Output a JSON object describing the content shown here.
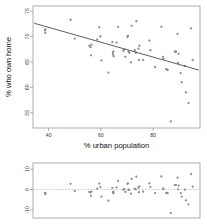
{
  "figure": {
    "background": "#ffffff",
    "point_color": "#8c8c8c",
    "line_color": "#4d4d4d",
    "axis_color": "#9a9a9a"
  },
  "chart_data": [
    {
      "type": "scatter",
      "panel": "main",
      "title": "",
      "xlabel": "% urban population",
      "ylabel": "% who own home",
      "xlim": [
        34,
        98
      ],
      "ylim": [
        52,
        76
      ],
      "xticks": [
        40,
        60,
        80
      ],
      "xticklabels": [
        "40",
        "60",
        "80"
      ],
      "yticks": [
        55,
        60,
        65,
        70,
        75
      ],
      "yticklabels": [
        "55",
        "60",
        "65",
        "70",
        "75"
      ],
      "grid": false,
      "legend": null,
      "regression_line": {
        "x": [
          34.5,
          97.5
        ],
        "y": [
          72.6,
          63.4
        ],
        "slope": -0.146,
        "intercept": 77.63
      },
      "points": [
        [
          38.6,
          71.2
        ],
        [
          38.7,
          70.7
        ],
        [
          38.8,
          71.4
        ],
        [
          48.4,
          73.3
        ],
        [
          50.0,
          69.6
        ],
        [
          55.6,
          68.2
        ],
        [
          56.0,
          67.9
        ],
        [
          56.2,
          66.3
        ],
        [
          56.4,
          68.4
        ],
        [
          58.6,
          69.4
        ],
        [
          59.4,
          71.8
        ],
        [
          59.8,
          70.0
        ],
        [
          60.2,
          65.3
        ],
        [
          62.9,
          62.9
        ],
        [
          64.4,
          68.9
        ],
        [
          64.6,
          66.8
        ],
        [
          64.7,
          66.4
        ],
        [
          64.8,
          67.0
        ],
        [
          64.9,
          66.1
        ],
        [
          66.0,
          68.8
        ],
        [
          66.6,
          71.9
        ],
        [
          68.6,
          67.2
        ],
        [
          69.0,
          67.4
        ],
        [
          69.4,
          66.0
        ],
        [
          70.2,
          69.9
        ],
        [
          70.4,
          70.1
        ],
        [
          70.6,
          67.0
        ],
        [
          70.9,
          66.8
        ],
        [
          71.5,
          64.9
        ],
        [
          71.8,
          72.1
        ],
        [
          73.0,
          67.3
        ],
        [
          73.4,
          66.8
        ],
        [
          73.6,
          73.0
        ],
        [
          74.4,
          67.6
        ],
        [
          74.6,
          65.4
        ],
        [
          74.8,
          68.2
        ],
        [
          76.2,
          65.4
        ],
        [
          78.6,
          69.2
        ],
        [
          79.0,
          67.3
        ],
        [
          80.8,
          64.0
        ],
        [
          83.2,
          71.9
        ],
        [
          83.8,
          66.0
        ],
        [
          84.0,
          65.6
        ],
        [
          85.0,
          63.6
        ],
        [
          85.4,
          63.5
        ],
        [
          85.6,
          63.4
        ],
        [
          86.8,
          53.3
        ],
        [
          88.4,
          67.0
        ],
        [
          88.6,
          67.0
        ],
        [
          88.8,
          67.0
        ],
        [
          89.4,
          70.5
        ],
        [
          89.6,
          64.8
        ],
        [
          89.8,
          66.6
        ],
        [
          90.6,
          62.8
        ],
        [
          91.0,
          61.0
        ],
        [
          92.2,
          64.2
        ],
        [
          92.6,
          59.0
        ],
        [
          93.6,
          56.9
        ],
        [
          94.6,
          71.6
        ],
        [
          95.2,
          65.4
        ]
      ]
    },
    {
      "type": "scatter",
      "panel": "residuals",
      "title": "",
      "xlabel": "",
      "ylabel": "",
      "xlim": [
        34,
        98
      ],
      "ylim": [
        -14,
        13
      ],
      "xticks": [],
      "xticklabels": [],
      "yticks": [
        -10,
        0,
        10
      ],
      "yticklabels": [
        "-10",
        "0",
        "10"
      ],
      "grid": false,
      "legend": null,
      "zero_line": 0,
      "points": [
        [
          38.6,
          -1.8
        ],
        [
          38.7,
          -2.3
        ],
        [
          38.8,
          -1.6
        ],
        [
          48.4,
          2.8
        ],
        [
          50.0,
          -0.7
        ],
        [
          55.6,
          -1.2
        ],
        [
          56.0,
          -1.5
        ],
        [
          56.2,
          -3.1
        ],
        [
          56.4,
          -1.0
        ],
        [
          58.6,
          0.4
        ],
        [
          59.4,
          2.9
        ],
        [
          59.8,
          1.2
        ],
        [
          60.2,
          -3.5
        ],
        [
          62.9,
          -5.5
        ],
        [
          64.4,
          0.8
        ],
        [
          64.6,
          -1.3
        ],
        [
          64.7,
          -1.6
        ],
        [
          64.8,
          -1.0
        ],
        [
          64.9,
          -1.9
        ],
        [
          66.0,
          1.0
        ],
        [
          66.6,
          4.2
        ],
        [
          68.6,
          -0.1
        ],
        [
          69.0,
          0.2
        ],
        [
          69.4,
          -1.2
        ],
        [
          70.2,
          2.8
        ],
        [
          70.4,
          3.0
        ],
        [
          70.6,
          -0.1
        ],
        [
          70.9,
          -0.2
        ],
        [
          71.5,
          -2.0
        ],
        [
          71.8,
          5.2
        ],
        [
          73.0,
          0.4
        ],
        [
          73.4,
          0.0
        ],
        [
          73.6,
          6.3
        ],
        [
          74.4,
          0.9
        ],
        [
          74.6,
          -1.3
        ],
        [
          74.8,
          1.5
        ],
        [
          76.2,
          -1.1
        ],
        [
          78.6,
          3.0
        ],
        [
          79.0,
          1.2
        ],
        [
          80.8,
          -1.8
        ],
        [
          83.2,
          6.4
        ],
        [
          83.8,
          0.6
        ],
        [
          84.0,
          0.2
        ],
        [
          85.0,
          -1.6
        ],
        [
          85.4,
          -1.7
        ],
        [
          85.6,
          -1.8
        ],
        [
          86.8,
          -11.5
        ],
        [
          88.4,
          2.2
        ],
        [
          88.6,
          2.2
        ],
        [
          88.8,
          2.2
        ],
        [
          89.4,
          5.8
        ],
        [
          89.6,
          0.1
        ],
        [
          89.8,
          1.9
        ],
        [
          90.6,
          -1.8
        ],
        [
          91.0,
          -3.5
        ],
        [
          92.2,
          -0.1
        ],
        [
          92.6,
          -5.3
        ],
        [
          93.6,
          -7.3
        ],
        [
          94.6,
          7.5
        ],
        [
          95.2,
          1.4
        ]
      ]
    }
  ]
}
